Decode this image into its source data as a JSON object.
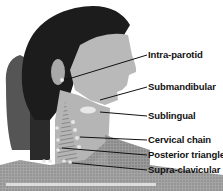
{
  "figure": {
    "labels": [
      {
        "text": "Intra-parotid"
      },
      {
        "text": "Submandibular"
      },
      {
        "text": "Sublingual"
      },
      {
        "text": "Cervical chain"
      },
      {
        "text": "Posterior triangle"
      },
      {
        "text": "Supra-clavicular"
      }
    ]
  }
}
